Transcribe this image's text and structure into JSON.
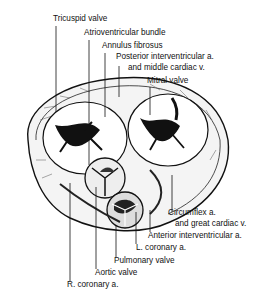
{
  "figure": {
    "labels": {
      "tricuspid_valve": "Tricuspid valve",
      "atrioventricular_bundle": "Atrioventricular bundle",
      "annulus_fibrosus": "Annulus fibrosus",
      "posterior_interventricular_line1": "Posterior interventricular a.",
      "posterior_interventricular_line2": "and middle cardiac v.",
      "mitral_valve": "Mitral valve",
      "circumflex_line1": "Circumflex a.",
      "circumflex_line2": "and great cardiac v.",
      "anterior_interventricular": "Anterior interventricular a.",
      "l_coronary": "L. coronary a.",
      "pulmonary_valve": "Pulmonary valve",
      "aortic_valve": "Aortic valve",
      "r_coronary": "R. coronary a."
    }
  }
}
